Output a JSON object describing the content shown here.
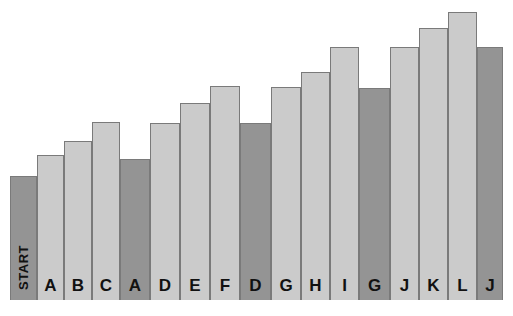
{
  "chart_data": {
    "type": "bar",
    "title": "",
    "subtitle": "",
    "xlabel": "",
    "ylabel": "",
    "grid": false,
    "legend": "none",
    "ylim": [
      0,
      100
    ],
    "categories": [
      "START",
      "A",
      "B",
      "C",
      "A",
      "D",
      "E",
      "F",
      "D",
      "G",
      "H",
      "I",
      "G",
      "J",
      "K",
      "L",
      "J"
    ],
    "values": [
      42,
      53,
      62,
      70,
      51,
      70,
      77,
      84,
      69,
      83,
      88,
      96,
      82,
      96,
      101,
      107,
      96
    ],
    "series": [
      {
        "name": "progress",
        "values": [
          42,
          53,
          62,
          70,
          51,
          70,
          77,
          84,
          69,
          83,
          88,
          96,
          82,
          96,
          101,
          107,
          96
        ]
      }
    ],
    "bars": [
      {
        "label": "START",
        "value": 42,
        "shade": "dark",
        "left": 10,
        "width": 27,
        "top": 176,
        "vertical_label": true
      },
      {
        "label": "A",
        "value": 53,
        "shade": "light",
        "left": 37,
        "width": 27,
        "top": 155,
        "vertical_label": false
      },
      {
        "label": "B",
        "value": 62,
        "shade": "light",
        "left": 64,
        "width": 28,
        "top": 141,
        "vertical_label": false
      },
      {
        "label": "C",
        "value": 70,
        "shade": "light",
        "left": 92,
        "width": 28,
        "top": 122,
        "vertical_label": false
      },
      {
        "label": "A",
        "value": 51,
        "shade": "dark",
        "left": 120,
        "width": 30,
        "top": 159,
        "vertical_label": false
      },
      {
        "label": "D",
        "value": 70,
        "shade": "light",
        "left": 150,
        "width": 30,
        "top": 123,
        "vertical_label": false
      },
      {
        "label": "E",
        "value": 77,
        "shade": "light",
        "left": 180,
        "width": 30,
        "top": 103,
        "vertical_label": false
      },
      {
        "label": "F",
        "value": 84,
        "shade": "light",
        "left": 210,
        "width": 30,
        "top": 86,
        "vertical_label": false
      },
      {
        "label": "D",
        "value": 69,
        "shade": "dark",
        "left": 240,
        "width": 31,
        "top": 123,
        "vertical_label": false
      },
      {
        "label": "G",
        "value": 83,
        "shade": "light",
        "left": 271,
        "width": 30,
        "top": 87,
        "vertical_label": false
      },
      {
        "label": "H",
        "value": 88,
        "shade": "light",
        "left": 301,
        "width": 29,
        "top": 72,
        "vertical_label": false
      },
      {
        "label": "I",
        "value": 96,
        "shade": "light",
        "left": 330,
        "width": 29,
        "top": 47,
        "vertical_label": false
      },
      {
        "label": "G",
        "value": 82,
        "shade": "dark",
        "left": 359,
        "width": 31,
        "top": 88,
        "vertical_label": false
      },
      {
        "label": "J",
        "value": 96,
        "shade": "light",
        "left": 390,
        "width": 29,
        "top": 47,
        "vertical_label": false
      },
      {
        "label": "K",
        "value": 101,
        "shade": "light",
        "left": 419,
        "width": 29,
        "top": 28,
        "vertical_label": false
      },
      {
        "label": "L",
        "value": 107,
        "shade": "light",
        "left": 448,
        "width": 29,
        "top": 12,
        "vertical_label": false
      },
      {
        "label": "J",
        "value": 96,
        "shade": "dark",
        "left": 477,
        "width": 26,
        "top": 47,
        "vertical_label": false
      }
    ],
    "colors": {
      "background": "#ffffff",
      "bar_light": "#cbcbcb",
      "bar_dark": "#949494",
      "bar_border": "#7a7a7a",
      "label_text": "#111111"
    },
    "baseline_y": 300,
    "annotations": []
  }
}
